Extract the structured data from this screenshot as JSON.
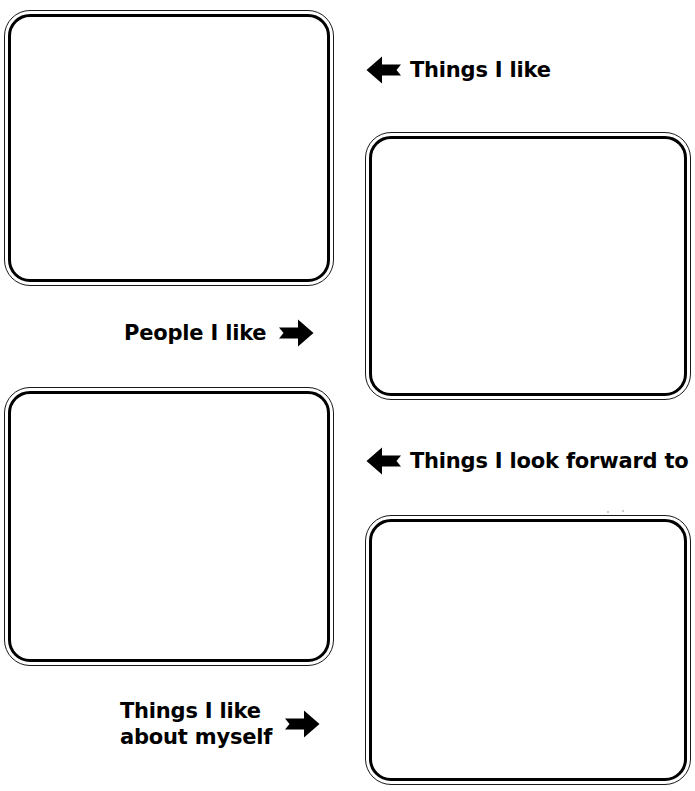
{
  "worksheet": {
    "title": "Things I Like Worksheet",
    "background_color": "#ffffff",
    "ink_color": "#000000"
  },
  "boxes": [
    {
      "id": "people-i-like",
      "label_ref": "People I like",
      "content": ""
    },
    {
      "id": "things-i-like",
      "label_ref": "Things I like",
      "content": ""
    },
    {
      "id": "things-about-self",
      "label_ref": "Things I like about myself",
      "content": ""
    },
    {
      "id": "things-forward",
      "label_ref": "Things I look forward to",
      "content": ""
    }
  ],
  "labels": {
    "things_i_like": {
      "text": "Things I like",
      "arrow": "arrow-left-icon",
      "arrow_direction": "left"
    },
    "people_i_like": {
      "text": "People I like",
      "arrow": "arrow-right-icon",
      "arrow_direction": "right"
    },
    "things_i_look_forward_to": {
      "text": "Things I look forward to",
      "arrow": "arrow-left-icon",
      "arrow_direction": "left"
    },
    "things_i_like_about_myself": {
      "line1": "Things I like",
      "line2": "about myself",
      "arrow": "arrow-right-icon",
      "arrow_direction": "right"
    }
  }
}
